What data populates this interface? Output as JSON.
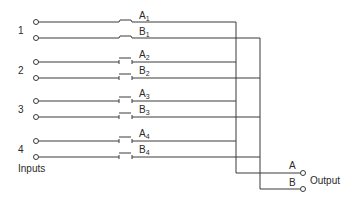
{
  "diagram": {
    "type": "multiplexer-switch-schematic",
    "inputs_label": "Inputs",
    "output_label": "Output",
    "colors": {
      "line": "#3a3a3a",
      "text": "#2a2a2a",
      "background": "#ffffff"
    },
    "inputs": [
      {
        "number": "1",
        "channels": [
          {
            "name": "A",
            "sub": "1",
            "state": "closed"
          },
          {
            "name": "B",
            "sub": "1",
            "state": "closed"
          }
        ]
      },
      {
        "number": "2",
        "channels": [
          {
            "name": "A",
            "sub": "2",
            "state": "open"
          },
          {
            "name": "B",
            "sub": "2",
            "state": "open"
          }
        ]
      },
      {
        "number": "3",
        "channels": [
          {
            "name": "A",
            "sub": "3",
            "state": "open"
          },
          {
            "name": "B",
            "sub": "3",
            "state": "open"
          }
        ]
      },
      {
        "number": "4",
        "channels": [
          {
            "name": "A",
            "sub": "4",
            "state": "open"
          },
          {
            "name": "B",
            "sub": "4",
            "state": "open"
          }
        ]
      }
    ],
    "outputs": [
      {
        "name": "A"
      },
      {
        "name": "B"
      }
    ]
  }
}
